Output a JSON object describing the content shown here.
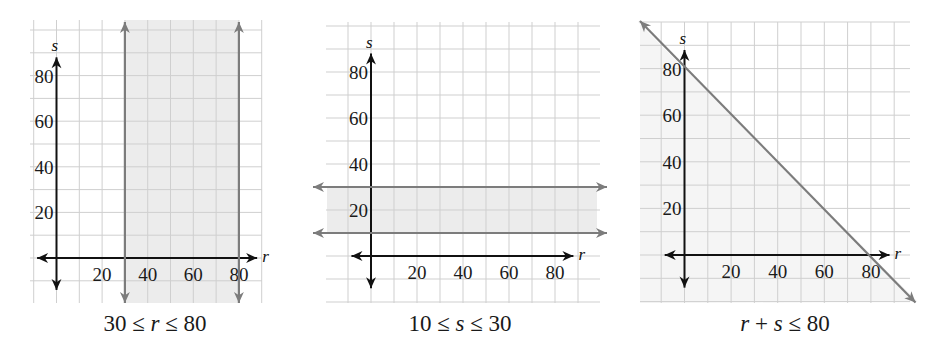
{
  "figure": {
    "style": {
      "grid_color": "#cfcfcf",
      "axis_color": "#111111",
      "boundary_color": "#7c7c7c",
      "shade_color": "#ececec",
      "shade_color_light": "#f5f5f5"
    }
  },
  "chart_data": [
    {
      "type": "inequality-graph",
      "title": "30 ≤ r ≤ 80",
      "caption_parts": [
        "30 ≤ ",
        "r",
        " ≤ 80"
      ],
      "xlabel": "r",
      "ylabel": "s",
      "x_ticks": [
        20,
        40,
        60,
        80
      ],
      "y_ticks": [
        20,
        40,
        60,
        80
      ],
      "xlim": [
        -10,
        90
      ],
      "ylim": [
        -20,
        90
      ],
      "grid": true,
      "grid_step": 10,
      "boundaries": [
        {
          "kind": "vertical",
          "r": 30,
          "style": "solid"
        },
        {
          "kind": "vertical",
          "r": 80,
          "style": "solid"
        }
      ],
      "shaded_region": "30 <= r <= 80",
      "layout": {
        "origin_px": [
          56.5,
          258
        ],
        "unit_px": 2.28,
        "grid_px": [
          30,
          20,
          262,
          303
        ]
      }
    },
    {
      "type": "inequality-graph",
      "title": "10 ≤ s ≤ 30",
      "caption_parts": [
        "10 ≤ ",
        "s",
        " ≤ 30"
      ],
      "xlabel": "r",
      "ylabel": "s",
      "x_ticks": [
        20,
        40,
        60,
        80
      ],
      "y_ticks": [
        20,
        40,
        60,
        80
      ],
      "xlim": [
        -20,
        100
      ],
      "ylim": [
        -20,
        90
      ],
      "grid": true,
      "grid_step": 10,
      "boundaries": [
        {
          "kind": "horizontal",
          "s": 10,
          "style": "solid"
        },
        {
          "kind": "horizontal",
          "s": 30,
          "style": "solid"
        }
      ],
      "shaded_region": "10 <= s <= 30",
      "layout": {
        "origin_px": [
          371,
          256
        ],
        "unit_px": 2.3,
        "grid_px": [
          326,
          22,
          600,
          303
        ]
      }
    },
    {
      "type": "inequality-graph",
      "title": "r + s ≤ 80",
      "caption_parts": [
        "r",
        " + ",
        "s",
        " ≤ 80"
      ],
      "xlabel": "r",
      "ylabel": "s",
      "x_ticks": [
        20,
        40,
        60,
        80
      ],
      "y_ticks": [
        20,
        40,
        60,
        80
      ],
      "xlim": [
        -20,
        100
      ],
      "ylim": [
        -20,
        100
      ],
      "grid": true,
      "grid_step": 10,
      "boundaries": [
        {
          "kind": "line",
          "points": [
            [
              -20,
              100
            ],
            [
              100,
              -20
            ]
          ],
          "equation": "r + s = 80",
          "style": "solid"
        }
      ],
      "shaded_region": "r + s <= 80",
      "layout": {
        "origin_px": [
          684.5,
          255
        ],
        "unit_px": 2.33,
        "grid_px": [
          640,
          22,
          910,
          303
        ]
      }
    }
  ]
}
